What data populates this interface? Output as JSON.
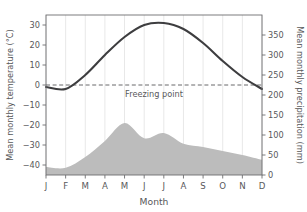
{
  "chart_data": {
    "type": "line",
    "title": "",
    "subtitle": "",
    "xlabel": "Month",
    "categories": [
      "J",
      "F",
      "M",
      "A",
      "M",
      "J",
      "J",
      "A",
      "S",
      "O",
      "N",
      "D"
    ],
    "month_names": [
      "January",
      "February",
      "March",
      "April",
      "May",
      "June",
      "July",
      "August",
      "September",
      "October",
      "November",
      "December"
    ],
    "grid": true,
    "legend_position": "none",
    "axes": {
      "left": {
        "label": "Mean monthly temperature (°C)",
        "ticks": [
          30,
          20,
          10,
          0,
          -10,
          -20,
          -30,
          -40
        ],
        "tick_labels": [
          "30",
          "20",
          "10",
          "0",
          "−10",
          "−20",
          "−30",
          "−40"
        ],
        "min": -45,
        "max": 35,
        "unit": "°C"
      },
      "right": {
        "label": "Mean monthly precipitation (mm)",
        "ticks": [
          0,
          50,
          100,
          150,
          200,
          250,
          300,
          350
        ],
        "tick_labels": [
          "0",
          "50",
          "100",
          "150",
          "200",
          "250",
          "300",
          "350"
        ],
        "min": 0,
        "max": 400,
        "unit": "mm"
      }
    },
    "series": [
      {
        "name": "Mean monthly temperature",
        "type": "line",
        "axis": "left",
        "unit": "°C",
        "color": "#3d3d3f",
        "values": [
          -1,
          -2,
          5,
          15,
          24,
          30,
          31,
          28,
          21,
          12,
          4,
          -2
        ]
      },
      {
        "name": "Mean monthly precipitation",
        "type": "area",
        "axis": "right",
        "unit": "mm",
        "color": "#bcbcbc",
        "values": [
          20,
          18,
          45,
          85,
          130,
          92,
          105,
          78,
          70,
          60,
          50,
          38
        ]
      }
    ],
    "annotations": [
      {
        "name": "freezing-point",
        "text": "Freezing point",
        "axis": "left",
        "value": 0,
        "style": "dashed-horizontal-line",
        "color": "#58585a"
      }
    ]
  },
  "colors": {
    "temperature_line": "#3d3d3f",
    "precipitation_fill": "#bcbcbc",
    "gridline": "#e8e8e8",
    "axis": "#6e6e70",
    "text": "#58585a",
    "background": "#ffffff"
  }
}
